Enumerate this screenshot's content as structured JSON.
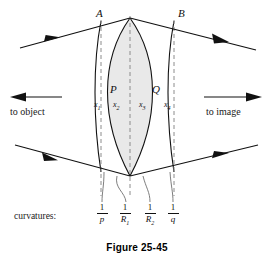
{
  "figure": {
    "caption": "Figure 25-45",
    "accent_color": "#111111",
    "lens_fill": "#e9e9e9",
    "dash_color": "#8c8c8c",
    "vertex_labels": [
      {
        "name": "A",
        "text": "A"
      },
      {
        "name": "B",
        "text": "B"
      },
      {
        "name": "P",
        "text": "P"
      },
      {
        "name": "Q",
        "text": "Q"
      }
    ],
    "segment_labels": [
      {
        "name": "x1",
        "base": "x",
        "sub": "1"
      },
      {
        "name": "x2",
        "base": "x",
        "sub": "2"
      },
      {
        "name": "x3",
        "base": "x",
        "sub": "3"
      },
      {
        "name": "x4",
        "base": "x",
        "sub": "4"
      }
    ],
    "side_labels": {
      "left": "to object",
      "right": "to image"
    },
    "curvatures": {
      "label": "curvatures:",
      "items": [
        {
          "name": "one-over-p",
          "numerator": "1",
          "denominator": "p",
          "denominator_sub": ""
        },
        {
          "name": "one-over-R1",
          "numerator": "1",
          "denominator": "R",
          "denominator_sub": "1"
        },
        {
          "name": "one-over-R2",
          "numerator": "1",
          "denominator": "R",
          "denominator_sub": "2"
        },
        {
          "name": "one-over-q",
          "numerator": "1",
          "denominator": "q",
          "denominator_sub": ""
        }
      ]
    }
  }
}
